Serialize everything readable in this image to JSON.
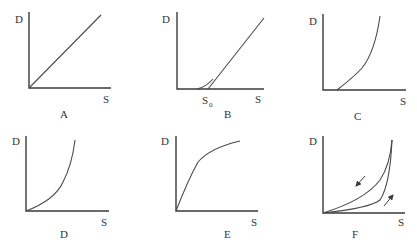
{
  "diagram": {
    "axis_labels": {
      "y": "D",
      "x": "S"
    },
    "panels": [
      {
        "id": "A",
        "caption": "A",
        "shape": "straight line through origin"
      },
      {
        "id": "B",
        "caption": "B",
        "shape": "linear above threshold S0 with curved toe",
        "threshold_label": "S",
        "threshold_sub": "0"
      },
      {
        "id": "C",
        "caption": "C",
        "shape": "convex curve starting at offset"
      },
      {
        "id": "D",
        "caption": "D",
        "shape": "convex curve through origin"
      },
      {
        "id": "E",
        "caption": "E",
        "shape": "concave saturating curve"
      },
      {
        "id": "F",
        "caption": "F",
        "shape": "hysteresis loop",
        "arrows": [
          "down-left on upper branch",
          "up-right on lower branch"
        ]
      }
    ]
  },
  "colors": {
    "line": "#4a4a4a",
    "axis": "#3a3a3a",
    "text": "#333333",
    "background": "#ffffff"
  }
}
